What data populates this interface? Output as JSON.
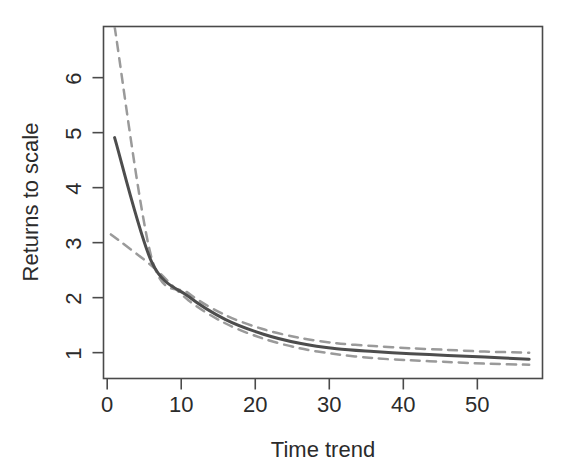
{
  "chart_data": {
    "type": "line",
    "title": "",
    "xlabel": "Time trend",
    "ylabel": "Returns to scale",
    "xlim": [
      -0.5,
      58.8
    ],
    "ylim": [
      0.53,
      6.93
    ],
    "grid": false,
    "legend": false,
    "legend_position": "none",
    "xticks": [
      0,
      10,
      20,
      30,
      40,
      50
    ],
    "xtick_labels": [
      "0",
      "10",
      "20",
      "30",
      "40",
      "50"
    ],
    "yticks": [
      1,
      2,
      3,
      4,
      5,
      6
    ],
    "ytick_labels": [
      "1",
      "2",
      "3",
      "4",
      "5",
      "6"
    ],
    "series": [
      {
        "name": "Returns to scale (estimate)",
        "style": "solid",
        "color": "#4d4d4d",
        "width": 3,
        "x": [
          1,
          6,
          11,
          16,
          21,
          26,
          31,
          36,
          41,
          46,
          51,
          57
        ],
        "values": [
          4.91,
          2.65,
          2.02,
          1.6,
          1.34,
          1.17,
          1.07,
          1.02,
          0.98,
          0.95,
          0.92,
          0.88
        ]
      },
      {
        "name": "Upper confidence band",
        "style": "dashed",
        "color": "#9a9a9a",
        "width": 2.5,
        "x": [
          1,
          6,
          11,
          16,
          21,
          26,
          31,
          36,
          41,
          46,
          51,
          57
        ],
        "values": [
          6.93,
          2.72,
          2.08,
          1.68,
          1.43,
          1.27,
          1.17,
          1.12,
          1.08,
          1.05,
          1.02,
          1.0
        ]
      },
      {
        "name": "Lower confidence band",
        "style": "dashed",
        "color": "#9a9a9a",
        "width": 2.5,
        "x": [
          0.5,
          6,
          11,
          16,
          21,
          26,
          31,
          36,
          41,
          46,
          51,
          57
        ],
        "values": [
          3.15,
          2.58,
          1.95,
          1.53,
          1.26,
          1.08,
          0.97,
          0.9,
          0.86,
          0.83,
          0.8,
          0.78
        ]
      }
    ]
  },
  "axes": {
    "x_title": "Time trend",
    "y_title": "Returns to scale"
  },
  "colors": {
    "line": "#4d4d4d",
    "band": "#9a9a9a",
    "frame": "#4a4a4a",
    "text": "#2b2b2b",
    "background": "#ffffff"
  }
}
